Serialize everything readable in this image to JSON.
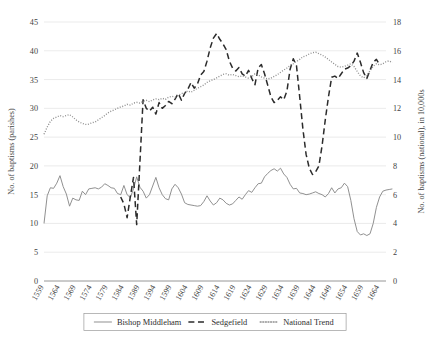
{
  "chart_data": {
    "type": "line",
    "title": "",
    "subtitle": "",
    "xlabel": "",
    "ylabel": "No. of baptisms (parishes)",
    "y2label": "No. of baptisms (national), in 10,000s",
    "grid": true,
    "legend_position": "bottom",
    "ylim": [
      0,
      45
    ],
    "y2lim": [
      0,
      18
    ],
    "yticks": [
      0,
      5,
      10,
      15,
      20,
      25,
      30,
      35,
      40,
      45
    ],
    "y2ticks": [
      0,
      2,
      4,
      6,
      8,
      10,
      12,
      14,
      16,
      18
    ],
    "xlim": [
      1559,
      1666
    ],
    "xticks": [
      "1559",
      "1564",
      "1569",
      "1574",
      "1579",
      "1584",
      "1589",
      "1594",
      "1599",
      "1604",
      "1609",
      "1614",
      "1619",
      "1624",
      "1629",
      "1634",
      "1639",
      "1644",
      "1649",
      "1654",
      "1659",
      "1664"
    ],
    "series": [
      {
        "name": "Bishop Middleham",
        "style": "solid",
        "color": "#8a8a8a",
        "axis": "left",
        "x_start": 1559,
        "values": [
          10.0,
          14.8,
          16.2,
          16.1,
          17.0,
          18.3,
          16.4,
          15.1,
          13.0,
          14.4,
          14.1,
          14.0,
          15.6,
          15.0,
          16.0,
          16.1,
          16.2,
          16.0,
          16.3,
          16.9,
          16.6,
          16.2,
          16.1,
          15.2,
          15.0,
          16.6,
          15.0,
          14.5,
          16.0,
          18.1,
          16.3,
          15.6,
          14.4,
          15.0,
          16.5,
          18.0,
          16.2,
          15.0,
          14.3,
          14.1,
          16.0,
          16.8,
          16.2,
          15.1,
          13.6,
          13.3,
          13.2,
          13.1,
          13.0,
          13.1,
          13.8,
          14.8,
          13.9,
          13.2,
          13.6,
          14.4,
          14.1,
          13.5,
          13.2,
          13.4,
          14.0,
          14.6,
          14.2,
          15.0,
          15.7,
          15.4,
          16.2,
          16.9,
          17.0,
          18.1,
          18.7,
          19.2,
          19.5,
          19.1,
          19.6,
          18.6,
          18.0,
          16.8,
          16.0,
          16.1,
          15.3,
          15.2,
          15.0,
          15.1,
          15.3,
          15.5,
          15.2,
          15.0,
          14.6,
          15.2,
          16.2,
          15.3,
          16.0,
          16.2,
          17.0,
          16.4,
          14.0,
          10.8,
          8.6,
          8.0,
          8.2,
          7.9,
          8.2,
          10.0,
          12.8,
          14.6,
          15.6,
          15.8,
          15.9,
          16.0
        ]
      },
      {
        "name": "Sedgefield",
        "style": "dashed",
        "color": "#2b2b2b",
        "axis": "left",
        "x_start": 1583,
        "values": [
          14.6,
          13.4,
          11.0,
          14.6,
          18.0,
          9.8,
          20.5,
          31.5,
          30.0,
          29.5,
          30.2,
          29.0,
          31.0,
          30.0,
          30.5,
          31.2,
          30.8,
          31.6,
          32.6,
          31.4,
          32.6,
          33.3,
          34.5,
          33.5,
          34.2,
          35.8,
          36.4,
          38.2,
          40.5,
          42.2,
          43.0,
          42.0,
          41.2,
          40.2,
          38.2,
          37.0,
          36.5,
          37.1,
          36.0,
          35.6,
          36.6,
          35.2,
          34.1,
          37.0,
          37.6,
          36.0,
          34.0,
          32.0,
          31.0,
          31.4,
          32.0,
          31.5,
          33.0,
          36.8,
          38.6,
          37.4,
          32.0,
          26.4,
          22.0,
          19.6,
          18.5,
          19.0,
          20.0,
          23.5,
          28.0,
          32.0,
          35.4,
          35.6,
          35.2,
          36.0,
          36.8,
          37.0,
          37.4,
          38.2,
          39.6,
          38.0,
          36.2,
          35.2,
          36.6,
          38.0,
          38.5,
          37.6
        ]
      },
      {
        "name": "National Trend",
        "style": "dotted",
        "color": "#8f8f8f",
        "axis": "right",
        "x_start": 1559,
        "values": [
          10.2,
          10.7,
          11.1,
          11.3,
          11.4,
          11.5,
          11.42,
          11.5,
          11.56,
          11.4,
          11.2,
          11.05,
          10.95,
          10.88,
          10.9,
          11.0,
          11.05,
          11.2,
          11.35,
          11.5,
          11.68,
          11.8,
          11.9,
          12.0,
          12.1,
          12.16,
          12.28,
          12.22,
          12.36,
          12.42,
          12.36,
          12.48,
          12.56,
          12.46,
          12.58,
          12.66,
          12.6,
          12.7,
          12.62,
          12.78,
          12.84,
          12.78,
          12.9,
          13.02,
          13.1,
          13.2,
          13.12,
          13.26,
          13.4,
          13.5,
          13.62,
          13.8,
          13.92,
          14.0,
          14.12,
          14.24,
          14.36,
          14.4,
          14.3,
          14.36,
          14.28,
          14.2,
          14.26,
          14.18,
          14.1,
          14.2,
          14.4,
          14.32,
          14.18,
          14.1,
          14.04,
          14.1,
          14.22,
          14.34,
          14.5,
          14.66,
          14.8,
          14.98,
          15.1,
          15.26,
          15.4,
          15.58,
          15.66,
          15.78,
          15.86,
          15.9,
          15.8,
          15.7,
          15.56,
          15.4,
          15.22,
          15.06,
          14.9,
          14.86,
          14.92,
          15.0,
          15.1,
          14.9,
          14.56,
          14.26,
          14.12,
          14.3,
          14.6,
          14.92,
          15.1,
          15.02,
          15.1,
          15.24,
          15.3,
          15.18
        ]
      }
    ]
  },
  "legend": {
    "items": [
      {
        "label": "Bishop Middleham",
        "style": "solid"
      },
      {
        "label": "Sedgefield",
        "style": "dashed"
      },
      {
        "label": "National Trend",
        "style": "dotted"
      }
    ]
  },
  "axes": {
    "left_title": "No. of baptisms (parishes)",
    "right_title": "No. of baptisms (national), in 10,000s"
  }
}
